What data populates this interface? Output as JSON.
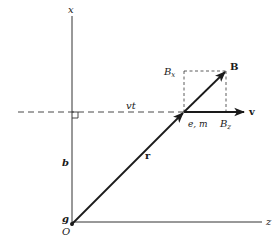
{
  "diagram": {
    "colors": {
      "ink": "#1a1a1a",
      "background": "#ffffff"
    },
    "axes": {
      "vertical": {
        "label": "x"
      },
      "horizontal": {
        "label": "z"
      }
    },
    "labels": {
      "origin": "O",
      "origin_point": "g",
      "impact_parameter": "b",
      "displacement": "vt",
      "position_vector": "r",
      "particle": "e, m",
      "velocity": "v",
      "field": "B",
      "field_x": "B",
      "field_x_sub": "x",
      "field_z": "B",
      "field_z_sub": "z"
    },
    "elements": [
      {
        "type": "axis",
        "name": "x-axis",
        "from": [
          72,
          16
        ],
        "to": [
          72,
          226
        ]
      },
      {
        "type": "axis",
        "name": "z-axis",
        "from": [
          72,
          222
        ],
        "to": [
          262,
          222
        ]
      },
      {
        "type": "dashed-line",
        "name": "trajectory",
        "from": [
          18,
          112
        ],
        "to": [
          184,
          112
        ]
      },
      {
        "type": "vector",
        "name": "r",
        "from": [
          72,
          224
        ],
        "to": [
          184,
          112
        ]
      },
      {
        "type": "vector",
        "name": "v",
        "from": [
          184,
          112
        ],
        "to": [
          244,
          112
        ]
      },
      {
        "type": "vector",
        "name": "B",
        "from": [
          184,
          112
        ],
        "to": [
          226,
          71
        ]
      },
      {
        "type": "dashed-line",
        "name": "Bx-projection",
        "from": [
          184,
          71
        ],
        "to": [
          226,
          71
        ]
      },
      {
        "type": "dashed-line",
        "name": "left-projection",
        "from": [
          184,
          71
        ],
        "to": [
          184,
          112
        ]
      },
      {
        "type": "dashed-line",
        "name": "Bz-projection",
        "from": [
          226,
          71
        ],
        "to": [
          226,
          112
        ]
      },
      {
        "type": "right-angle",
        "name": "perpendicular-marker",
        "at": [
          72,
          112
        ]
      }
    ]
  }
}
